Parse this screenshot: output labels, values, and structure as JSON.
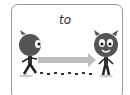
{
  "card": {
    "word": "to",
    "colors": {
      "border": "#9a9a9a",
      "arrow": "#b8b8b8",
      "character": "#5a5a5a"
    }
  }
}
